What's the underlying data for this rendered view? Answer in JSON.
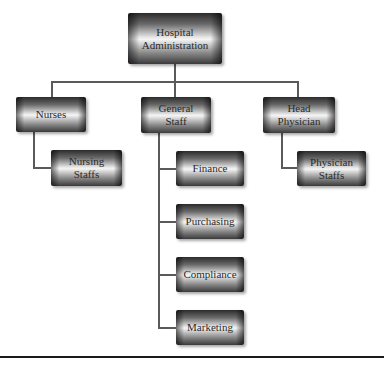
{
  "diagram": {
    "type": "org-chart",
    "root": {
      "label_line1": "Hospital",
      "label_line2": "Administration"
    },
    "level1": [
      {
        "id": "nurses",
        "label_line1": "Nurses",
        "label_line2": ""
      },
      {
        "id": "general-staff",
        "label_line1": "General",
        "label_line2": "Staff"
      },
      {
        "id": "head-physician",
        "label_line1": "Head",
        "label_line2": "Physician"
      }
    ],
    "nurses_children": [
      {
        "label_line1": "Nursing",
        "label_line2": "Staffs"
      }
    ],
    "general_staff_children": [
      {
        "label": "Finance"
      },
      {
        "label": "Purchasing"
      },
      {
        "label": "Compliance"
      },
      {
        "label": "Marketing"
      }
    ],
    "head_physician_children": [
      {
        "label_line1": "Physician",
        "label_line2": "Staffs"
      }
    ],
    "colors": {
      "line": "#5a5a5a",
      "box_dark": "#2b2b2b",
      "box_light": "#f4f4f4",
      "text": "#2a2a2a",
      "rule": "#1a1a1a"
    }
  }
}
